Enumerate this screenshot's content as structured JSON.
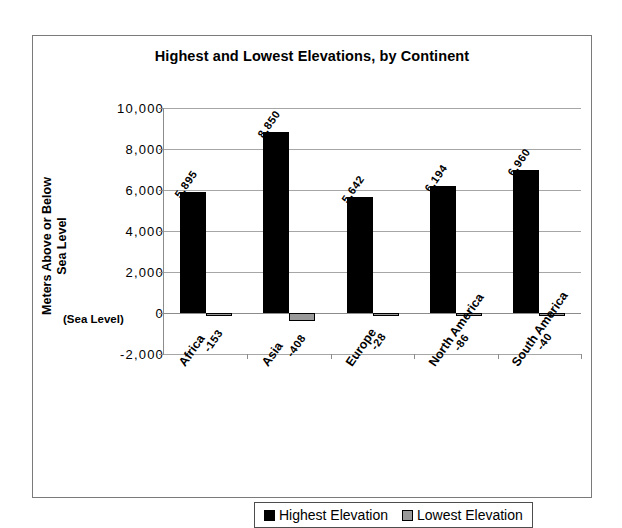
{
  "chart_data": {
    "type": "bar",
    "title": "Highest and Lowest Elevations, by Continent",
    "xlabel": "",
    "ylabel": "Meters Above or Below Sea Level",
    "ylim": [
      -2000,
      10000
    ],
    "ytick_labels": [
      "10,000",
      "8,000",
      "6,000",
      "4,000",
      "2,000",
      "0",
      "-2,000"
    ],
    "ytick_values": [
      10000,
      8000,
      6000,
      4000,
      2000,
      0,
      -2000
    ],
    "zero_annotation": "(Sea Level)",
    "grid": true,
    "legend_position": "bottom",
    "categories": [
      "Africa",
      "Asia",
      "Europe",
      "North America",
      "South America"
    ],
    "series": [
      {
        "name": "Highest Elevation",
        "color": "#000000",
        "values": [
          5895,
          8850,
          5642,
          6194,
          6960
        ],
        "labels": [
          "5,895",
          "8,850",
          "5,642",
          "6,194",
          "6,960"
        ]
      },
      {
        "name": "Lowest Elevation",
        "color": "#999999",
        "values": [
          -153,
          -408,
          -28,
          -86,
          -40
        ],
        "labels": [
          "-153",
          "-408",
          "-28",
          "-86",
          "-40"
        ]
      }
    ]
  },
  "legend": {
    "items": [
      {
        "label": "Highest Elevation"
      },
      {
        "label": "Lowest Elevation"
      }
    ]
  }
}
